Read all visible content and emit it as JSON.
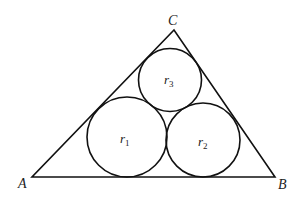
{
  "diagram": {
    "triangle": {
      "vertices": {
        "A": {
          "label": "A",
          "x": 32,
          "y": 177
        },
        "B": {
          "label": "B",
          "x": 275,
          "y": 177
        },
        "C": {
          "label": "C",
          "x": 174,
          "y": 30
        }
      }
    },
    "circles": [
      {
        "id": "r1",
        "label_main": "r",
        "label_sub": "1",
        "cx": 127,
        "cy": 137,
        "r": 40
      },
      {
        "id": "r2",
        "label_main": "r",
        "label_sub": "2",
        "cx": 203,
        "cy": 140,
        "r": 37
      },
      {
        "id": "r3",
        "label_main": "r",
        "label_sub": "3",
        "cx": 170,
        "cy": 80,
        "r": 31.5
      }
    ],
    "labels": {
      "A": "A",
      "B": "B",
      "C": "C",
      "r1_main": "r",
      "r1_sub": "1",
      "r2_main": "r",
      "r2_sub": "2",
      "r3_main": "r",
      "r3_sub": "3"
    },
    "colors": {
      "stroke": "#111111",
      "text": "#222222",
      "background": "#ffffff"
    }
  }
}
